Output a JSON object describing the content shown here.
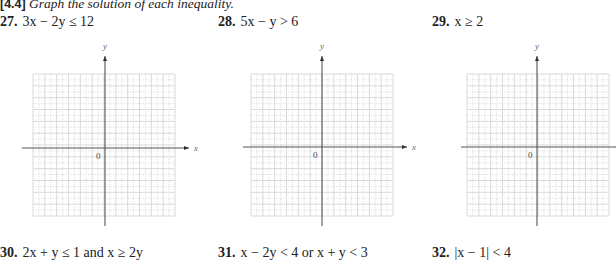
{
  "header": {
    "section": "[4.4]",
    "instruction": "Graph the solution of each inequality."
  },
  "problems": [
    {
      "number": "27.",
      "expression": "3x − 2y ≤ 12",
      "has_graph": true
    },
    {
      "number": "28.",
      "expression": "5x − y > 6",
      "has_graph": true
    },
    {
      "number": "29.",
      "expression": "x ≥ 2",
      "has_graph": true
    },
    {
      "number": "30.",
      "expression": "2x + y ≤ 1 and x ≥ 2y",
      "has_graph": false
    },
    {
      "number": "31.",
      "expression": "x − 2y < 4 or x + y < 3",
      "has_graph": false
    },
    {
      "number": "32.",
      "expression": "|x − 1| < 4",
      "has_graph": false
    }
  ],
  "graph_labels": {
    "x_axis": "x",
    "y_axis": "y",
    "origin": "0"
  },
  "grid": {
    "major_divisions": 12,
    "major_color": "#d6d6d6",
    "minor_color": "#c8c8c8",
    "axis_color": "#555555"
  }
}
